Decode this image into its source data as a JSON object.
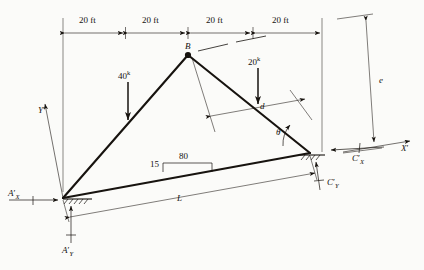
{
  "figure": {
    "stroke_color": "#17130f",
    "background": "#fbfbf9"
  },
  "dimensions": {
    "top_segments": [
      {
        "label": "20 ft"
      },
      {
        "label": "20 ft"
      },
      {
        "label": "20 ft"
      },
      {
        "label": "20 ft"
      }
    ],
    "vertical_right": {
      "label": "e"
    },
    "span": {
      "label": "L"
    },
    "member_offset": {
      "label": "d"
    },
    "slope_rise": {
      "label": "15"
    },
    "slope_run": {
      "label": "80"
    },
    "angle": {
      "label": "θ"
    }
  },
  "joints": {
    "apex": {
      "label": "B"
    },
    "left_support": {
      "label": "A"
    },
    "right_support": {
      "label": "C"
    }
  },
  "loads": [
    {
      "name": "left-load",
      "label": "40",
      "unit": "k"
    },
    {
      "name": "right-load",
      "label": "20",
      "unit": "k"
    }
  ],
  "reactions": [
    {
      "name": "reaction-ax",
      "base": "A",
      "sub": "X",
      "prime": "′"
    },
    {
      "name": "reaction-ay",
      "base": "A",
      "sub": "Y",
      "prime": "′"
    },
    {
      "name": "reaction-cx",
      "base": "C",
      "sub": "X",
      "prime": "′"
    },
    {
      "name": "reaction-cy",
      "base": "C",
      "sub": "Y",
      "prime": "′"
    }
  ],
  "axes": [
    {
      "name": "axis-y-prime",
      "base": "Y",
      "prime": "′"
    },
    {
      "name": "axis-x-prime",
      "base": "X",
      "prime": "′"
    }
  ]
}
